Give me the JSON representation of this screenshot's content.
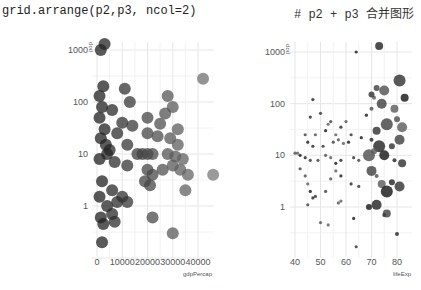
{
  "code": {
    "command": "grid.arrange(p2,p3, ncol=2)",
    "comment": "# p2 + p3 合并图形"
  },
  "chart_data": [
    {
      "type": "scatter",
      "title": "",
      "xlabel": "gdpPercap",
      "ylabel": "pop",
      "yscale": "log10",
      "x_ticks": [
        "0",
        "10000",
        "20000",
        "30000",
        "40000"
      ],
      "y_ticks": [
        "1",
        "10",
        "100",
        "1000"
      ],
      "xlim": [
        0,
        47000
      ],
      "ylim": [
        0.15,
        1500
      ],
      "grid": true,
      "legend": "none",
      "point_size": "large",
      "points": [
        [
          1500,
          1000
        ],
        [
          3000,
          1300
        ],
        [
          42000,
          280
        ],
        [
          2500,
          200
        ],
        [
          11000,
          180
        ],
        [
          1000,
          130
        ],
        [
          28000,
          130
        ],
        [
          13000,
          100
        ],
        [
          2000,
          80
        ],
        [
          6000,
          70
        ],
        [
          30000,
          80
        ],
        [
          27000,
          60
        ],
        [
          20000,
          50
        ],
        [
          10000,
          40
        ],
        [
          25000,
          38
        ],
        [
          14000,
          35
        ],
        [
          32000,
          30
        ],
        [
          3000,
          30
        ],
        [
          8000,
          25
        ],
        [
          20000,
          25
        ],
        [
          24000,
          22
        ],
        [
          29000,
          20
        ],
        [
          12000,
          15
        ],
        [
          32000,
          15
        ],
        [
          1500,
          20
        ],
        [
          5000,
          12
        ],
        [
          16000,
          10
        ],
        [
          18000,
          10
        ],
        [
          20000,
          10
        ],
        [
          22000,
          10
        ],
        [
          28000,
          10
        ],
        [
          31000,
          9
        ],
        [
          34000,
          8
        ],
        [
          4000,
          10
        ],
        [
          1000,
          8
        ],
        [
          7000,
          7
        ],
        [
          12000,
          6
        ],
        [
          20000,
          5
        ],
        [
          22000,
          4
        ],
        [
          26000,
          5
        ],
        [
          30000,
          6
        ],
        [
          33000,
          5
        ],
        [
          36000,
          4
        ],
        [
          46000,
          4
        ],
        [
          19000,
          3
        ],
        [
          21000,
          2.5
        ],
        [
          35000,
          2
        ],
        [
          2000,
          3
        ],
        [
          6000,
          2
        ],
        [
          10000,
          1.5
        ],
        [
          8000,
          1.2
        ],
        [
          12000,
          1.2
        ],
        [
          1000,
          1.5
        ],
        [
          4000,
          1
        ],
        [
          6000,
          0.7
        ],
        [
          1500,
          0.6
        ],
        [
          7000,
          0.5
        ],
        [
          22000,
          0.6
        ],
        [
          30000,
          0.3
        ],
        [
          2000,
          0.2
        ],
        [
          2500,
          0.45
        ],
        [
          3500,
          15
        ],
        [
          1000,
          50
        ]
      ]
    },
    {
      "type": "scatter",
      "title": "",
      "xlabel": "lifeExp",
      "ylabel": "pop",
      "yscale": "log10",
      "x_ticks": [
        "40",
        "50",
        "60",
        "70",
        "80"
      ],
      "y_ticks": [
        "1",
        "10",
        "100",
        "1000"
      ],
      "xlim": [
        38,
        84
      ],
      "ylim": [
        0.15,
        1500
      ],
      "grid": true,
      "legend": "none",
      "point_size": "mapped to gdpPercap",
      "points": [
        [
          64,
          1000
        ],
        [
          73,
          1300
        ],
        [
          81,
          280
        ],
        [
          72,
          200
        ],
        [
          75,
          180
        ],
        [
          71,
          130
        ],
        [
          83,
          130
        ],
        [
          47,
          120
        ],
        [
          70,
          150
        ],
        [
          74,
          100
        ],
        [
          70,
          80
        ],
        [
          79,
          80
        ],
        [
          68,
          60
        ],
        [
          46,
          55
        ],
        [
          50,
          65
        ],
        [
          54,
          45
        ],
        [
          60,
          45
        ],
        [
          53,
          40
        ],
        [
          52,
          30
        ],
        [
          58,
          35
        ],
        [
          62,
          25
        ],
        [
          44,
          25
        ],
        [
          48,
          25
        ],
        [
          56,
          25
        ],
        [
          66,
          22
        ],
        [
          70,
          20
        ],
        [
          72,
          30
        ],
        [
          76,
          40
        ],
        [
          80,
          50
        ],
        [
          82,
          35
        ],
        [
          45,
          18
        ],
        [
          47,
          15
        ],
        [
          51,
          15
        ],
        [
          55,
          18
        ],
        [
          57,
          20
        ],
        [
          59,
          17
        ],
        [
          61,
          18
        ],
        [
          73,
          15
        ],
        [
          78,
          15
        ],
        [
          81,
          20
        ],
        [
          40,
          11
        ],
        [
          41,
          11
        ],
        [
          42,
          10
        ],
        [
          44,
          9
        ],
        [
          46,
          8
        ],
        [
          49,
          8
        ],
        [
          52,
          10
        ],
        [
          54,
          9
        ],
        [
          56,
          7
        ],
        [
          58,
          8
        ],
        [
          63,
          9
        ],
        [
          65,
          8
        ],
        [
          69,
          10
        ],
        [
          71,
          12
        ],
        [
          75,
          10
        ],
        [
          79,
          8
        ],
        [
          82,
          7
        ],
        [
          42,
          5.5
        ],
        [
          44,
          4
        ],
        [
          45,
          2.8
        ],
        [
          46,
          2
        ],
        [
          47,
          1.5
        ],
        [
          48,
          1.6
        ],
        [
          52,
          2
        ],
        [
          54,
          3.5
        ],
        [
          56,
          5
        ],
        [
          58,
          4
        ],
        [
          62,
          2.8
        ],
        [
          65,
          2.5
        ],
        [
          70,
          5
        ],
        [
          72,
          4
        ],
        [
          74,
          2.8
        ],
        [
          76,
          2
        ],
        [
          78,
          3
        ],
        [
          81,
          2.5
        ],
        [
          45,
          1.1
        ],
        [
          57,
          1.2
        ],
        [
          58,
          1.3
        ],
        [
          69,
          1
        ],
        [
          72,
          1.1
        ],
        [
          75,
          0.7
        ],
        [
          76,
          0.75
        ],
        [
          50,
          0.5
        ],
        [
          53,
          0.45
        ],
        [
          63,
          0.6
        ],
        [
          80,
          0.3
        ],
        [
          64,
          0.17
        ]
      ]
    }
  ]
}
